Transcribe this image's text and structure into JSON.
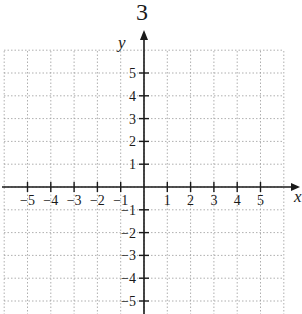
{
  "header": {
    "fragment_text": "3",
    "fragment_left": "y"
  },
  "chart_data": {
    "type": "line",
    "title": "",
    "xlabel": "x",
    "ylabel": "y",
    "xlim": [
      -6,
      6
    ],
    "ylim": [
      -5.5,
      6
    ],
    "grid": true,
    "grid_style": "dotted",
    "x_ticks": [
      -5,
      -4,
      -3,
      -2,
      -1,
      1,
      2,
      3,
      4,
      5
    ],
    "y_ticks": [
      5,
      4,
      3,
      2,
      1,
      -1,
      -2,
      -3,
      -4,
      -5
    ],
    "x_tick_labels": [
      "−5",
      "−4",
      "−3",
      "−2",
      "−1",
      "1",
      "2",
      "3",
      "4",
      "5"
    ],
    "y_tick_labels": [
      "5",
      "4",
      "3",
      "2",
      "1",
      "−1",
      "−2",
      "−3",
      "−4",
      "−5"
    ],
    "series": []
  },
  "colors": {
    "axis": "#1a1a1a",
    "grid": "#9a9a9a",
    "background": "#ffffff"
  }
}
